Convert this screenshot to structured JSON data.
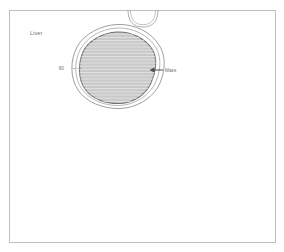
{
  "figure": {
    "kind": "medical-anatomical-illustration",
    "background_color": "#ffffff",
    "frame": {
      "stroke_color": "#b9b9b9",
      "x": 9,
      "y": 10,
      "width": 267,
      "height": 233
    }
  },
  "labels": {
    "organ": "Liver",
    "capsule_callout": "60",
    "mass_callout": "Mass"
  },
  "colors": {
    "mass_fill": "#c9c9c9",
    "mass_outline": "#6f6f6f",
    "hatch_line": "#e4e4e4",
    "capsule_outline": "#8d8d8d",
    "vessel_outline": "#9a9a9a",
    "arrow": "#4a4a4a",
    "text": "#6e6e6e",
    "frame": "#b9b9b9"
  },
  "geometry": {
    "mass_center_x": 117,
    "mass_center_y": 68,
    "mass_radius_x": 38,
    "mass_radius_y": 36,
    "hatch_spacing": 3.2,
    "vessel_arc_center_x": 143,
    "vessel_arc_center_y": 10,
    "vessel_arc_radius": 15
  },
  "annotations": {
    "organ_label_x": 30,
    "organ_label_y": 35,
    "capsule_label_x": 64,
    "capsule_label_y": 70,
    "capsule_leader_from_x": 72,
    "capsule_leader_to_x": 82,
    "capsule_leader_y": 68.5,
    "mass_arrow_tip_x": 150,
    "mass_arrow_tail_x": 163,
    "mass_arrow_y": 70,
    "mass_label_x": 165,
    "mass_label_y": 71.5
  }
}
